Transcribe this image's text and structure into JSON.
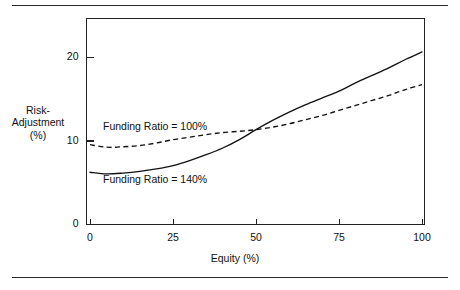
{
  "figure": {
    "rules": {
      "top": true,
      "bottom": true
    }
  },
  "chart_data": {
    "type": "line",
    "title": "",
    "xlabel": "Equity (%)",
    "ylabel": "Risk-Adjustment (%)",
    "ylabel_lines": [
      "Risk-",
      "Adjustment",
      "(%)"
    ],
    "xlim": [
      0,
      105
    ],
    "ylim": [
      0,
      25
    ],
    "xticks": [
      0,
      25,
      50,
      75,
      100
    ],
    "xtick_labels": [
      "0",
      "25",
      "50",
      "75",
      "100"
    ],
    "yticks": [
      0,
      10,
      20
    ],
    "ytick_labels": [
      "0",
      "10",
      "20"
    ],
    "grid": false,
    "legend": "inline-annotations",
    "x": [
      0,
      5,
      10,
      15,
      20,
      25,
      30,
      35,
      40,
      45,
      50,
      55,
      60,
      65,
      70,
      75,
      80,
      85,
      90,
      95,
      100
    ],
    "series": [
      {
        "name": "Funding Ratio = 100%",
        "style": "dashed",
        "color": "#111111",
        "annotation": "Funding Ratio = 100%",
        "values": [
          9.5,
          9.2,
          9.25,
          9.4,
          9.7,
          10.1,
          10.4,
          10.7,
          10.95,
          11.1,
          11.3,
          11.6,
          12.0,
          12.5,
          13.0,
          13.6,
          14.2,
          14.8,
          15.4,
          16.1,
          16.7
        ]
      },
      {
        "name": "Funding Ratio = 140%",
        "style": "solid",
        "color": "#111111",
        "annotation": "Funding Ratio = 140%",
        "values": [
          6.2,
          6.0,
          6.1,
          6.3,
          6.6,
          7.0,
          7.6,
          8.3,
          9.1,
          10.1,
          11.3,
          12.4,
          13.4,
          14.3,
          15.1,
          15.9,
          16.9,
          17.8,
          18.7,
          19.7,
          20.6
        ]
      }
    ],
    "crossing_point": {
      "x": 47,
      "y": 11.1
    }
  }
}
